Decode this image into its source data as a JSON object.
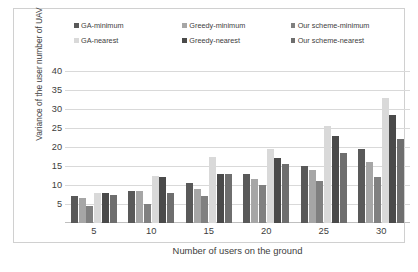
{
  "chart_data": {
    "type": "bar",
    "title": "",
    "xlabel": "Number of users on the ground",
    "ylabel": "Variance of the user number of UAV",
    "categories": [
      "5",
      "10",
      "15",
      "20",
      "25",
      "30"
    ],
    "ylim": [
      0,
      40
    ],
    "ytick_labels": [
      "40",
      "35",
      "30",
      "25",
      "20",
      "15",
      "10",
      "5"
    ],
    "ytick_values": [
      40,
      35,
      30,
      25,
      20,
      15,
      10,
      5
    ],
    "grid": true,
    "legend_position": "top",
    "series": [
      {
        "name": "GA-minimum",
        "color": "#595959",
        "values": [
          7.0,
          8.5,
          10.5,
          13.0,
          15.0,
          19.5
        ]
      },
      {
        "name": "Greedy-minimum",
        "color": "#a6a6a6",
        "values": [
          6.5,
          8.5,
          9.0,
          11.5,
          14.0,
          16.0
        ]
      },
      {
        "name": "Our scheme-minimum",
        "color": "#808080",
        "values": [
          4.5,
          5.0,
          7.0,
          10.0,
          11.0,
          12.0
        ]
      },
      {
        "name": "GA-nearest",
        "color": "#d9d9d9",
        "values": [
          8.0,
          12.5,
          17.5,
          19.5,
          25.5,
          33.0
        ]
      },
      {
        "name": "Greedy-nearest",
        "color": "#4a4a4a",
        "values": [
          8.0,
          12.0,
          13.0,
          17.0,
          23.0,
          28.5
        ]
      },
      {
        "name": "Our scheme-nearest",
        "color": "#6e6e6e",
        "values": [
          7.5,
          8.0,
          13.0,
          15.5,
          18.5,
          22.0
        ]
      }
    ]
  },
  "legend": {
    "items": [
      {
        "label": "GA-minimum"
      },
      {
        "label": "Greedy-minimum"
      },
      {
        "label": "Our scheme-minimum"
      },
      {
        "label": "GA-nearest"
      },
      {
        "label": "Greedy-nearest"
      },
      {
        "label": "Our scheme-nearest"
      }
    ]
  }
}
